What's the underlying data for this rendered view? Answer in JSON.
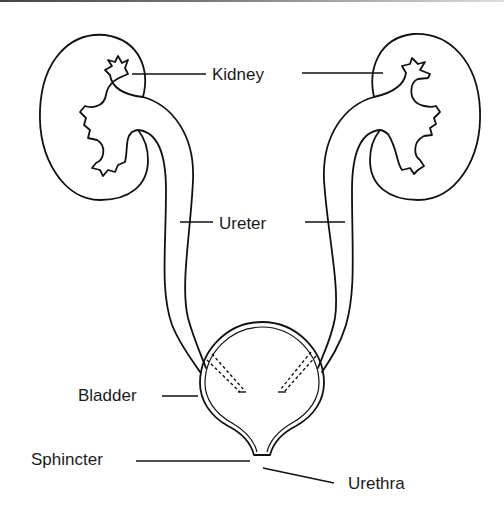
{
  "diagram": {
    "labels": {
      "kidney": "Kidney",
      "ureter": "Ureter",
      "bladder": "Bladder",
      "sphincter": "Sphincter",
      "urethra": "Urethra"
    },
    "colors": {
      "stroke": "#111111",
      "text": "#1a1a1a",
      "background": "#ffffff"
    }
  }
}
